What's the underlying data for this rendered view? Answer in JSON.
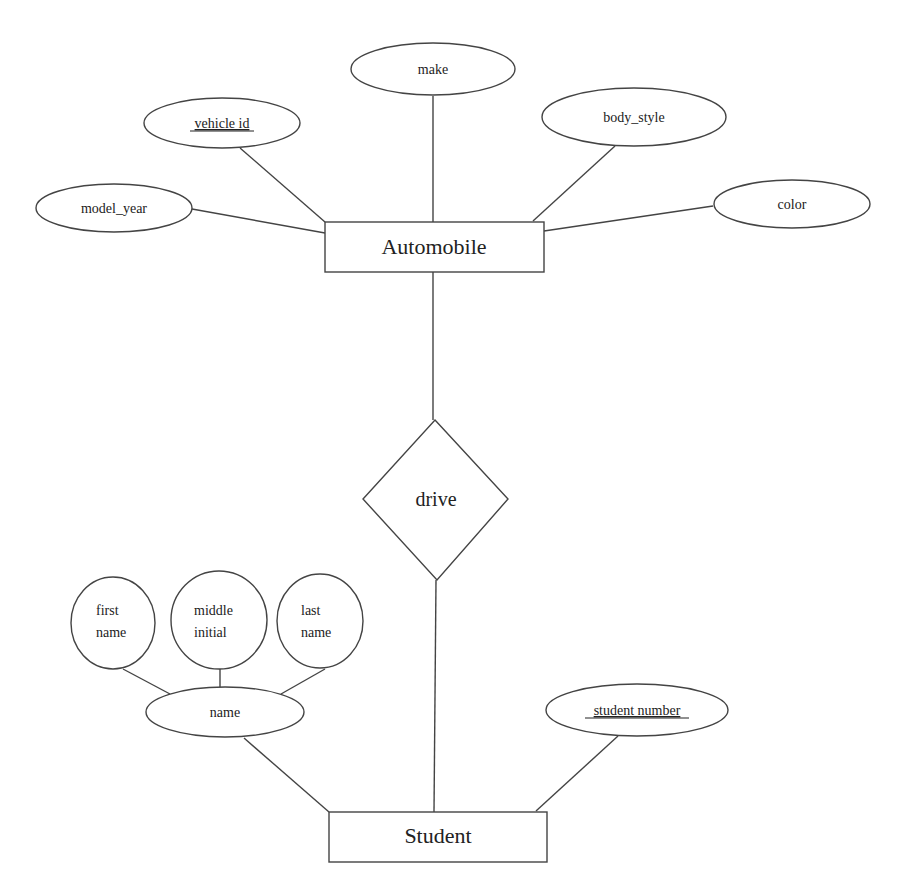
{
  "diagram": {
    "type": "entity-relationship",
    "colors": {
      "stroke": "#444444",
      "text": "#222222",
      "background": "#ffffff"
    },
    "entities": [
      {
        "id": "automobile",
        "label": "Automobile"
      },
      {
        "id": "student",
        "label": "Student"
      }
    ],
    "relationships": [
      {
        "id": "drive",
        "label": "drive",
        "connects": [
          "automobile",
          "student"
        ]
      }
    ],
    "attributes": {
      "automobile": [
        {
          "id": "make",
          "label": "make",
          "key": false
        },
        {
          "id": "vehicle_id",
          "label": "vehicle id",
          "key": true
        },
        {
          "id": "body_style",
          "label": "body_style",
          "key": false
        },
        {
          "id": "model_year",
          "label": "model_year",
          "key": false
        },
        {
          "id": "color",
          "label": "color",
          "key": false
        }
      ],
      "student": [
        {
          "id": "name",
          "label": "name",
          "key": false,
          "composite": true
        },
        {
          "id": "student_number",
          "label": "student number",
          "key": true
        }
      ],
      "name_components": [
        {
          "id": "first_name",
          "line1": "first",
          "line2": "name"
        },
        {
          "id": "middle_initial",
          "line1": "middle",
          "line2": "initial"
        },
        {
          "id": "last_name",
          "line1": "last",
          "line2": "name"
        }
      ]
    }
  }
}
